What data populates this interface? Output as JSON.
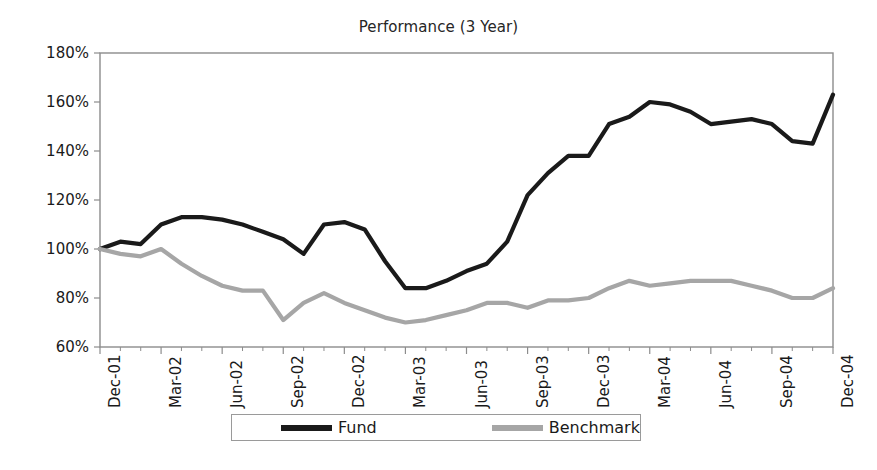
{
  "chart_data": {
    "type": "line",
    "title": "Performance (3 Year)",
    "xlabel": "",
    "ylabel": "",
    "ylim": [
      60,
      180
    ],
    "ytick_values": [
      60,
      80,
      100,
      120,
      140,
      160,
      180
    ],
    "ytick_labels": [
      "60%",
      "80%",
      "100%",
      "120%",
      "140%",
      "160%",
      "180%"
    ],
    "grid": false,
    "legend_position": "bottom",
    "x": [
      "Dec-01",
      "Jan-02",
      "Feb-02",
      "Mar-02",
      "Apr-02",
      "May-02",
      "Jun-02",
      "Jul-02",
      "Aug-02",
      "Sep-02",
      "Oct-02",
      "Nov-02",
      "Dec-02",
      "Jan-03",
      "Feb-03",
      "Mar-03",
      "Apr-03",
      "May-03",
      "Jun-03",
      "Jul-03",
      "Aug-03",
      "Sep-03",
      "Oct-03",
      "Nov-03",
      "Dec-03",
      "Jan-04",
      "Feb-04",
      "Mar-04",
      "Apr-04",
      "May-04",
      "Jun-04",
      "Jul-04",
      "Aug-04",
      "Sep-04",
      "Oct-04",
      "Nov-04",
      "Dec-04"
    ],
    "xtick_labels": [
      "Dec-01",
      "Mar-02",
      "Jun-02",
      "Sep-02",
      "Dec-02",
      "Mar-03",
      "Jun-03",
      "Sep-03",
      "Dec-03",
      "Mar-04",
      "Jun-04",
      "Sep-04",
      "Dec-04"
    ],
    "xtick_indices": [
      0,
      3,
      6,
      9,
      12,
      15,
      18,
      21,
      24,
      27,
      30,
      33,
      36
    ],
    "series": [
      {
        "name": "Fund",
        "color": "#1a1a1a",
        "values": [
          100,
          103,
          102,
          110,
          113,
          113,
          112,
          110,
          107,
          104,
          98,
          110,
          111,
          108,
          95,
          84,
          84,
          87,
          91,
          94,
          103,
          122,
          131,
          138,
          138,
          151,
          154,
          160,
          159,
          156,
          151,
          152,
          153,
          151,
          144,
          143,
          163
        ]
      },
      {
        "name": "Benchmark",
        "color": "#a6a6a6",
        "values": [
          100,
          98,
          97,
          100,
          94,
          89,
          85,
          83,
          83,
          71,
          78,
          82,
          78,
          75,
          72,
          70,
          71,
          73,
          75,
          78,
          78,
          76,
          79,
          79,
          80,
          84,
          87,
          85,
          86,
          87,
          87,
          87,
          85,
          83,
          80,
          80,
          84
        ]
      }
    ]
  },
  "legend": {
    "entries": [
      {
        "label": "Fund"
      },
      {
        "label": "Benchmark"
      }
    ]
  }
}
